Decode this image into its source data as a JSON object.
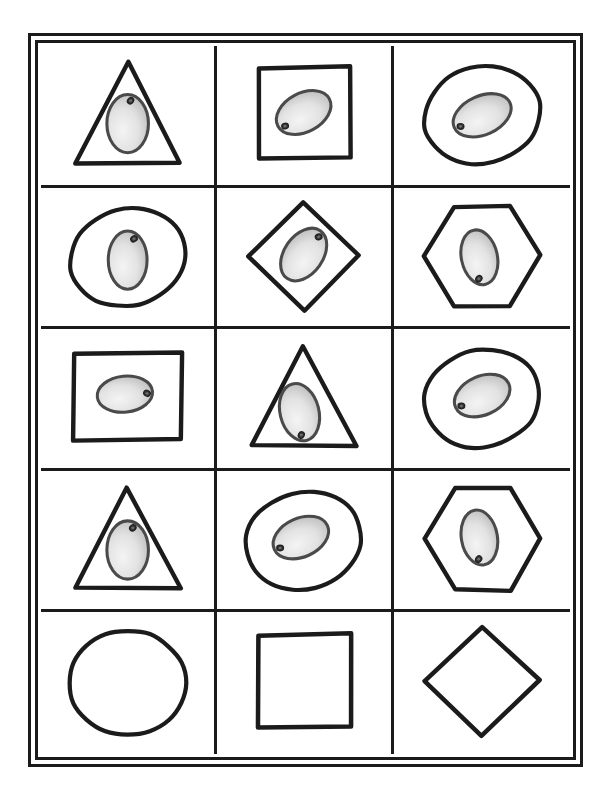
{
  "page": {
    "background_color": "#ffffff",
    "ink_color": "#1b1b1b",
    "egg_fill_light": "#f4f4f4",
    "egg_fill_dark": "#a9a9a9",
    "egg_spot_color": "#3a3a3a",
    "frame_style": "double-line-border",
    "columns": 3,
    "rows": 5,
    "total_cells": 15
  },
  "legend": {
    "shape_names": [
      "triangle",
      "square",
      "oval",
      "oval",
      "diamond",
      "hexagon",
      "rectangle",
      "triangle",
      "oval",
      "triangle",
      "oval",
      "hexagon",
      "circle",
      "square",
      "diamond"
    ],
    "egg_present_label": "egg",
    "empty_label": "empty"
  },
  "cells": [
    {
      "index": 1,
      "row": 1,
      "col": 1,
      "shape": "triangle",
      "shape_label": "triangle",
      "has_egg": true,
      "egg_label": "egg",
      "egg_orientation": "vertical",
      "egg_rotation_deg": 0,
      "egg_cx": 50,
      "egg_cy": 56,
      "egg_rx": 15,
      "egg_ry": 21,
      "spot_angle_deg": -80,
      "spot_label": "dark-spot"
    },
    {
      "index": 2,
      "row": 1,
      "col": 2,
      "shape": "square",
      "shape_label": "square",
      "has_egg": true,
      "egg_label": "egg",
      "egg_orientation": "diagonal",
      "egg_rotation_deg": -28,
      "egg_cx": 50,
      "egg_cy": 48,
      "egg_rx": 21,
      "egg_ry": 14,
      "spot_angle_deg": 168,
      "spot_label": "dark-spot"
    },
    {
      "index": 3,
      "row": 1,
      "col": 3,
      "shape": "oval",
      "shape_label": "oval",
      "has_egg": true,
      "egg_label": "egg",
      "egg_orientation": "diagonal",
      "egg_rotation_deg": -24,
      "egg_cx": 50,
      "egg_cy": 50,
      "egg_rx": 22,
      "egg_ry": 14,
      "spot_angle_deg": 175,
      "spot_label": "dark-spot"
    },
    {
      "index": 4,
      "row": 2,
      "col": 1,
      "shape": "oval",
      "shape_label": "oval",
      "has_egg": true,
      "egg_label": "egg",
      "egg_orientation": "vertical",
      "egg_rotation_deg": 0,
      "egg_cx": 50,
      "egg_cy": 52,
      "egg_rx": 14,
      "egg_ry": 21,
      "spot_angle_deg": -66,
      "spot_label": "dark-spot"
    },
    {
      "index": 5,
      "row": 2,
      "col": 2,
      "shape": "diamond",
      "shape_label": "diamond",
      "has_egg": true,
      "egg_label": "egg",
      "egg_orientation": "diagonal",
      "egg_rotation_deg": -55,
      "egg_cx": 50,
      "egg_cy": 48,
      "egg_rx": 21,
      "egg_ry": 14,
      "spot_angle_deg": 8,
      "spot_label": "dark-spot"
    },
    {
      "index": 6,
      "row": 2,
      "col": 3,
      "shape": "hexagon",
      "shape_label": "hexagon",
      "has_egg": true,
      "egg_label": "egg",
      "egg_orientation": "vertical",
      "egg_rotation_deg": -12,
      "egg_cx": 48,
      "egg_cy": 50,
      "egg_rx": 13,
      "egg_ry": 20,
      "spot_angle_deg": 110,
      "spot_label": "dark-spot"
    },
    {
      "index": 7,
      "row": 3,
      "col": 1,
      "shape": "rectangle",
      "shape_label": "rectangle",
      "has_egg": true,
      "egg_label": "egg",
      "egg_orientation": "horizontal",
      "egg_rotation_deg": -6,
      "egg_cx": 48,
      "egg_cy": 47,
      "egg_rx": 20,
      "egg_ry": 13,
      "spot_angle_deg": 6,
      "spot_label": "dark-spot"
    },
    {
      "index": 8,
      "row": 3,
      "col": 2,
      "shape": "triangle",
      "shape_label": "triangle",
      "has_egg": true,
      "egg_label": "egg",
      "egg_orientation": "vertical",
      "egg_rotation_deg": -14,
      "egg_cx": 47,
      "egg_cy": 60,
      "egg_rx": 14,
      "egg_ry": 21,
      "spot_angle_deg": 104,
      "spot_label": "dark-spot"
    },
    {
      "index": 9,
      "row": 3,
      "col": 3,
      "shape": "oval",
      "shape_label": "oval",
      "has_egg": true,
      "egg_label": "egg",
      "egg_orientation": "diagonal",
      "egg_rotation_deg": -24,
      "egg_cx": 50,
      "egg_cy": 48,
      "egg_rx": 21,
      "egg_ry": 14,
      "spot_angle_deg": 176,
      "spot_label": "dark-spot"
    },
    {
      "index": 10,
      "row": 4,
      "col": 1,
      "shape": "triangle",
      "shape_label": "triangle",
      "has_egg": true,
      "egg_label": "egg",
      "egg_orientation": "vertical",
      "egg_rotation_deg": 0,
      "egg_cx": 50,
      "egg_cy": 57,
      "egg_rx": 15,
      "egg_ry": 21,
      "spot_angle_deg": -72,
      "spot_label": "dark-spot"
    },
    {
      "index": 11,
      "row": 4,
      "col": 2,
      "shape": "oval",
      "shape_label": "oval",
      "has_egg": true,
      "egg_label": "egg",
      "egg_orientation": "diagonal",
      "egg_rotation_deg": -24,
      "egg_cx": 48,
      "egg_cy": 48,
      "egg_rx": 21,
      "egg_ry": 14,
      "spot_angle_deg": 176,
      "spot_label": "dark-spot"
    },
    {
      "index": 12,
      "row": 4,
      "col": 3,
      "shape": "hexagon",
      "shape_label": "hexagon",
      "has_egg": true,
      "egg_label": "egg",
      "egg_orientation": "vertical",
      "egg_rotation_deg": -10,
      "egg_cx": 48,
      "egg_cy": 48,
      "egg_rx": 13,
      "egg_ry": 20,
      "spot_angle_deg": 108,
      "spot_label": "dark-spot"
    },
    {
      "index": 13,
      "row": 5,
      "col": 1,
      "shape": "circle",
      "shape_label": "circle",
      "has_egg": false,
      "egg_label": "empty",
      "egg_orientation": "none",
      "egg_rotation_deg": 0,
      "egg_cx": 50,
      "egg_cy": 50,
      "egg_rx": 0,
      "egg_ry": 0,
      "spot_angle_deg": 0,
      "spot_label": ""
    },
    {
      "index": 14,
      "row": 5,
      "col": 2,
      "shape": "square",
      "shape_label": "square",
      "has_egg": false,
      "egg_label": "empty",
      "egg_orientation": "none",
      "egg_rotation_deg": 0,
      "egg_cx": 50,
      "egg_cy": 50,
      "egg_rx": 0,
      "egg_ry": 0,
      "spot_angle_deg": 0,
      "spot_label": ""
    },
    {
      "index": 15,
      "row": 5,
      "col": 3,
      "shape": "diamond",
      "shape_label": "diamond",
      "has_egg": false,
      "egg_label": "empty",
      "egg_orientation": "none",
      "egg_rotation_deg": 0,
      "egg_cx": 50,
      "egg_cy": 50,
      "egg_rx": 0,
      "egg_ry": 0,
      "spot_angle_deg": 0,
      "spot_label": ""
    }
  ]
}
